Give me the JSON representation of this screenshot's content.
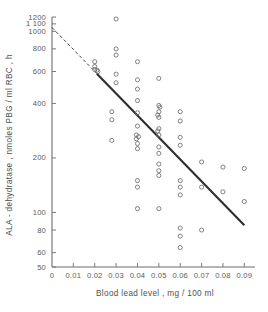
{
  "chart_data": {
    "type": "scatter",
    "title": "",
    "xlabel": "Blood lead level ,  mg / 100 ml",
    "ylabel": "ALA - dehydratase ,  nmoles PBG / ml RBC , h",
    "xlim": [
      0,
      0.095
    ],
    "ylim": [
      50,
      1200
    ],
    "yscale": "log",
    "xscale": "linear",
    "grid": false,
    "legend": null,
    "xticks": [
      0,
      0.01,
      0.02,
      0.03,
      0.04,
      0.05,
      0.06,
      0.07,
      0.08,
      0.09
    ],
    "xticklabels": [
      "0",
      "0.01",
      "0.02",
      "0.03",
      "0.04",
      "0.05",
      "0.06",
      "0.07",
      "0.08",
      "0.09"
    ],
    "yticks": [
      50,
      60,
      80,
      100,
      200,
      400,
      600,
      800,
      1000,
      1100,
      1200
    ],
    "yticklabels": [
      "50",
      "60",
      "80",
      "100",
      "200",
      "400",
      "600",
      "800",
      "1000",
      "1 100",
      "1200"
    ],
    "points": [
      {
        "x": 0.02,
        "y": 680
      },
      {
        "x": 0.02,
        "y": 640
      },
      {
        "x": 0.02,
        "y": 615
      },
      {
        "x": 0.021,
        "y": 610
      },
      {
        "x": 0.0215,
        "y": 600
      },
      {
        "x": 0.03,
        "y": 1170
      },
      {
        "x": 0.03,
        "y": 800
      },
      {
        "x": 0.03,
        "y": 740
      },
      {
        "x": 0.03,
        "y": 580
      },
      {
        "x": 0.03,
        "y": 520
      },
      {
        "x": 0.028,
        "y": 360
      },
      {
        "x": 0.028,
        "y": 325
      },
      {
        "x": 0.028,
        "y": 250
      },
      {
        "x": 0.04,
        "y": 680
      },
      {
        "x": 0.04,
        "y": 540
      },
      {
        "x": 0.04,
        "y": 480
      },
      {
        "x": 0.04,
        "y": 415
      },
      {
        "x": 0.04,
        "y": 355
      },
      {
        "x": 0.04,
        "y": 300
      },
      {
        "x": 0.0395,
        "y": 268
      },
      {
        "x": 0.0405,
        "y": 262
      },
      {
        "x": 0.0395,
        "y": 255
      },
      {
        "x": 0.04,
        "y": 240
      },
      {
        "x": 0.04,
        "y": 225
      },
      {
        "x": 0.04,
        "y": 150
      },
      {
        "x": 0.04,
        "y": 138
      },
      {
        "x": 0.04,
        "y": 105
      },
      {
        "x": 0.05,
        "y": 550
      },
      {
        "x": 0.05,
        "y": 390
      },
      {
        "x": 0.0505,
        "y": 382
      },
      {
        "x": 0.05,
        "y": 360
      },
      {
        "x": 0.0495,
        "y": 345
      },
      {
        "x": 0.05,
        "y": 335
      },
      {
        "x": 0.05,
        "y": 290
      },
      {
        "x": 0.0495,
        "y": 282
      },
      {
        "x": 0.05,
        "y": 268
      },
      {
        "x": 0.05,
        "y": 230
      },
      {
        "x": 0.05,
        "y": 212
      },
      {
        "x": 0.05,
        "y": 185
      },
      {
        "x": 0.05,
        "y": 170
      },
      {
        "x": 0.05,
        "y": 160
      },
      {
        "x": 0.05,
        "y": 105
      },
      {
        "x": 0.06,
        "y": 360
      },
      {
        "x": 0.06,
        "y": 320
      },
      {
        "x": 0.06,
        "y": 260
      },
      {
        "x": 0.06,
        "y": 235
      },
      {
        "x": 0.06,
        "y": 150
      },
      {
        "x": 0.06,
        "y": 138
      },
      {
        "x": 0.06,
        "y": 125
      },
      {
        "x": 0.06,
        "y": 82
      },
      {
        "x": 0.06,
        "y": 74
      },
      {
        "x": 0.06,
        "y": 64
      },
      {
        "x": 0.07,
        "y": 190
      },
      {
        "x": 0.07,
        "y": 138
      },
      {
        "x": 0.07,
        "y": 80
      },
      {
        "x": 0.08,
        "y": 178
      },
      {
        "x": 0.08,
        "y": 130
      },
      {
        "x": 0.09,
        "y": 175
      },
      {
        "x": 0.09,
        "y": 115
      }
    ],
    "fit_line": {
      "name": "regression line",
      "x_start": 0.0,
      "y_start": 1050,
      "x_end": 0.09,
      "y_end": 85,
      "solid_from_x": 0.021
    }
  }
}
